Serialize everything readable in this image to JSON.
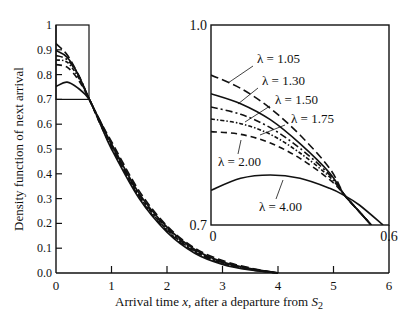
{
  "chart_data": [
    {
      "type": "line",
      "title": "",
      "xlabel": "Arrival time x, after a departure from S2",
      "ylabel": "Density function of next arrival",
      "xlim": [
        0,
        6
      ],
      "ylim": [
        0,
        1
      ],
      "x_ticks": [
        "0",
        "1",
        "2",
        "3",
        "4",
        "5",
        "6"
      ],
      "y_ticks": [
        "0.0",
        "0.1",
        "0.2",
        "0.3",
        "0.4",
        "0.5",
        "0.6",
        "0.7",
        "0.8",
        "0.9",
        "1"
      ],
      "grid": false,
      "legend": "none (curves labeled in inset)",
      "annotations": [
        "Rectangle marking zoom region x:[0,0.6], y:[0.7,1.0]"
      ],
      "series": [
        {
          "name": "λ = 1.05",
          "style": "dashed-long",
          "x": [
            0,
            0.2,
            0.4,
            0.6,
            0.8,
            1.0,
            1.5,
            2.0,
            2.5,
            3.0,
            3.5,
            4.0
          ],
          "values": [
            0.925,
            0.88,
            0.8,
            0.7,
            0.61,
            0.53,
            0.33,
            0.19,
            0.1,
            0.05,
            0.02,
            0.0
          ]
        },
        {
          "name": "λ = 1.30",
          "style": "solid",
          "x": [
            0,
            0.2,
            0.4,
            0.6,
            0.8,
            1.0,
            1.5,
            2.0,
            2.5,
            3.0,
            3.5,
            4.0
          ],
          "values": [
            0.897,
            0.87,
            0.8,
            0.7,
            0.61,
            0.52,
            0.32,
            0.185,
            0.095,
            0.045,
            0.018,
            0.0
          ]
        },
        {
          "name": "λ = 1.50",
          "style": "dash-dot",
          "x": [
            0,
            0.2,
            0.4,
            0.6,
            0.8,
            1.0,
            1.5,
            2.0,
            2.5,
            3.0,
            3.5,
            4.0
          ],
          "values": [
            0.877,
            0.86,
            0.8,
            0.7,
            0.61,
            0.52,
            0.315,
            0.18,
            0.09,
            0.042,
            0.016,
            0.0
          ]
        },
        {
          "name": "λ = 1.75",
          "style": "dotted-dash",
          "x": [
            0,
            0.2,
            0.4,
            0.6,
            0.8,
            1.0,
            1.5,
            2.0,
            2.5,
            3.0,
            3.5,
            4.0
          ],
          "values": [
            0.859,
            0.85,
            0.79,
            0.7,
            0.6,
            0.51,
            0.31,
            0.175,
            0.088,
            0.04,
            0.015,
            0.0
          ]
        },
        {
          "name": "λ = 2.00",
          "style": "dashed",
          "x": [
            0,
            0.2,
            0.4,
            0.6,
            0.8,
            1.0,
            1.5,
            2.0,
            2.5,
            3.0,
            3.5,
            4.0
          ],
          "values": [
            0.84,
            0.83,
            0.78,
            0.7,
            0.6,
            0.51,
            0.305,
            0.17,
            0.085,
            0.038,
            0.014,
            0.0
          ]
        },
        {
          "name": "λ = 4.00",
          "style": "solid",
          "x": [
            0,
            0.2,
            0.4,
            0.6,
            0.8,
            1.0,
            1.5,
            2.0,
            2.5,
            3.0,
            3.5,
            4.0
          ],
          "values": [
            0.752,
            0.77,
            0.745,
            0.7,
            0.6,
            0.5,
            0.3,
            0.165,
            0.08,
            0.035,
            0.012,
            0.0
          ]
        }
      ]
    },
    {
      "type": "line",
      "title": "Inset (zoom of region near origin)",
      "xlim": [
        0,
        0.6
      ],
      "ylim": [
        0.7,
        1.0
      ],
      "x_ticks": [
        "0",
        "0.6"
      ],
      "y_ticks": [
        "0.7",
        "1.0"
      ],
      "labels": [
        "λ = 1.05",
        "λ = 1.30",
        "λ = 1.50",
        "λ = 1.75",
        "λ = 2.00",
        "λ = 4.00"
      ],
      "series": [
        {
          "name": "λ = 1.05",
          "x": [
            0,
            0.1,
            0.2,
            0.3,
            0.4,
            0.45,
            0.5,
            0.54
          ],
          "values": [
            0.925,
            0.905,
            0.875,
            0.835,
            0.785,
            0.745,
            0.72,
            0.7
          ]
        },
        {
          "name": "λ = 1.30",
          "x": [
            0,
            0.1,
            0.2,
            0.3,
            0.4,
            0.45,
            0.5,
            0.54
          ],
          "values": [
            0.897,
            0.882,
            0.858,
            0.822,
            0.778,
            0.745,
            0.72,
            0.7
          ]
        },
        {
          "name": "λ = 1.50",
          "x": [
            0,
            0.1,
            0.2,
            0.3,
            0.4,
            0.45,
            0.5,
            0.54
          ],
          "values": [
            0.877,
            0.866,
            0.846,
            0.815,
            0.775,
            0.745,
            0.72,
            0.7
          ]
        },
        {
          "name": "λ = 1.75",
          "x": [
            0,
            0.1,
            0.2,
            0.3,
            0.4,
            0.45,
            0.5,
            0.54
          ],
          "values": [
            0.859,
            0.852,
            0.836,
            0.808,
            0.772,
            0.745,
            0.72,
            0.7
          ]
        },
        {
          "name": "λ = 2.00",
          "x": [
            0,
            0.1,
            0.2,
            0.3,
            0.4,
            0.45,
            0.5,
            0.54
          ],
          "values": [
            0.84,
            0.836,
            0.823,
            0.8,
            0.768,
            0.745,
            0.72,
            0.7
          ]
        },
        {
          "name": "λ = 4.00",
          "x": [
            0,
            0.1,
            0.2,
            0.3,
            0.4,
            0.45,
            0.5,
            0.58
          ],
          "values": [
            0.752,
            0.77,
            0.775,
            0.77,
            0.755,
            0.744,
            0.73,
            0.7
          ]
        }
      ]
    }
  ],
  "axes": {
    "ylabel": "Density function of next arrival",
    "xlabel_prefix": "Arrival time ",
    "xlabel_var": "x",
    "xlabel_mid": ", after a departure from ",
    "xlabel_S": "S",
    "xlabel_sub": "2",
    "x_ticks": [
      "0",
      "1",
      "2",
      "3",
      "4",
      "5",
      "6"
    ],
    "y_ticks": [
      "0.0",
      "0.1",
      "0.2",
      "0.3",
      "0.4",
      "0.5",
      "0.6",
      "0.7",
      "0.8",
      "0.9",
      "1"
    ]
  },
  "inset": {
    "y_top": "1.0",
    "y_bottom": "0.7",
    "x_left": "0",
    "x_right": "0.6",
    "labels": [
      "λ = 1.05",
      "λ = 1.30",
      "λ = 1.50",
      "λ = 1.75",
      "λ = 2.00",
      "λ = 4.00"
    ]
  }
}
